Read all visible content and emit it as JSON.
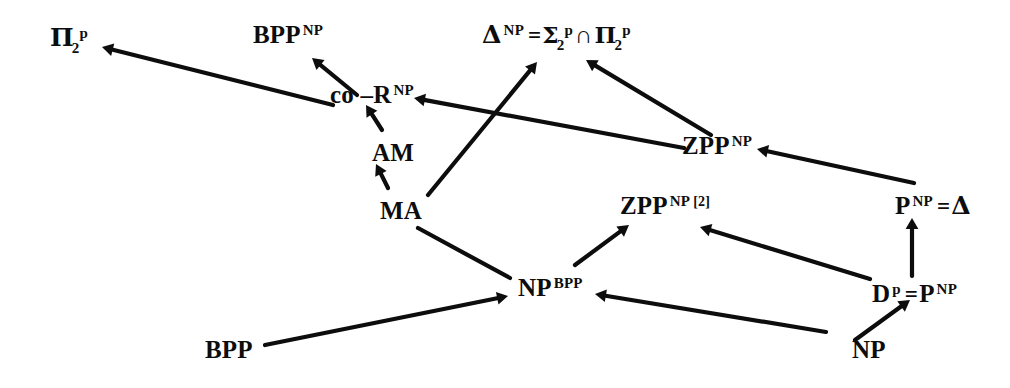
{
  "diagram": {
    "type": "directed-graph",
    "width": 1010,
    "height": 388,
    "background_color": "#ffffff",
    "ink_color": "#0d0d0d",
    "nodes": [
      {
        "id": "pi2p",
        "label": "Π₂ᵖ",
        "base": "Π",
        "sub": "2",
        "sup": "p",
        "x": 50,
        "y": 25
      },
      {
        "id": "bpp_np",
        "label": "BPPᴺᴾ",
        "base": "BPP",
        "sup": "NP",
        "x": 253,
        "y": 22
      },
      {
        "id": "delta_np",
        "label": "Δᴺᴾ = Σ₂ᵖ ∩ Π₂ᵖ",
        "base": "Δ",
        "sup": "NP",
        "equals": "=",
        "rhs_a_base": "Σ",
        "rhs_a_sub": "2",
        "rhs_a_sup": "p",
        "operator": "∩",
        "rhs_b_base": "Π",
        "rhs_b_sub": "2",
        "rhs_b_sup": "p",
        "x": 482,
        "y": 22
      },
      {
        "id": "cor_np",
        "label": "co–Rᴺᴾ",
        "base": "co –R",
        "sup": "NP",
        "x": 330,
        "y": 82
      },
      {
        "id": "am",
        "label": "AM",
        "base": "AM",
        "sup": "",
        "x": 372,
        "y": 140
      },
      {
        "id": "ma",
        "label": "MA",
        "base": "MA",
        "sup": "",
        "x": 380,
        "y": 198
      },
      {
        "id": "zpp_np",
        "label": "ZPPᴺᴾ",
        "base": "ZPP",
        "sup": "NP",
        "x": 682,
        "y": 133
      },
      {
        "id": "zpp_np2",
        "label": "ZPPᴺᴾ [2]",
        "base": "ZPP",
        "sup": "NP",
        "bracket": "[2]",
        "x": 620,
        "y": 193
      },
      {
        "id": "p_np_delta",
        "label": "Pᴺᴾ = Δ",
        "base": "P",
        "sup": "NP",
        "equals": "=",
        "tail": "Δ",
        "x": 895,
        "y": 193
      },
      {
        "id": "np_bpp",
        "label": "NPᴮᴺᴾ",
        "base": "NP",
        "sup": "BPP",
        "x": 518,
        "y": 275
      },
      {
        "id": "dp_pnp",
        "label": "Dᵖ = Pᴺᴾ",
        "base": "D",
        "sup": "p",
        "equals": "=",
        "tail": "P",
        "tail_sup": "NP",
        "x": 872,
        "y": 281
      },
      {
        "id": "bpp",
        "label": "BPP",
        "base": "BPP",
        "sup": "",
        "x": 205,
        "y": 337
      },
      {
        "id": "np",
        "label": "NP",
        "base": "NP",
        "sup": "",
        "x": 852,
        "y": 337
      }
    ],
    "edges": [
      {
        "id": "e1",
        "from": "cor_np",
        "to": "pi2p",
        "x1": 333,
        "y1": 105,
        "x2": 102,
        "y2": 47,
        "arrow_at": "head"
      },
      {
        "id": "e2",
        "from": "cor_np",
        "to": "bpp_np",
        "x1": 357,
        "y1": 95,
        "x2": 312,
        "y2": 58,
        "arrow_at": "head"
      },
      {
        "id": "e3",
        "from": "am",
        "to": "cor_np",
        "x1": 382,
        "y1": 130,
        "x2": 366,
        "y2": 105,
        "arrow_at": "head"
      },
      {
        "id": "e4",
        "from": "ma",
        "to": "am",
        "x1": 388,
        "y1": 188,
        "x2": 376,
        "y2": 164,
        "arrow_at": "head"
      },
      {
        "id": "e5",
        "from": "ma",
        "to": "delta_np",
        "x1": 428,
        "y1": 195,
        "x2": 537,
        "y2": 62,
        "arrow_at": "head"
      },
      {
        "id": "e6",
        "from": "zpp_np",
        "to": "cor_np",
        "x1": 684,
        "y1": 148,
        "x2": 414,
        "y2": 98,
        "arrow_at": "head"
      },
      {
        "id": "e7",
        "from": "zpp_np",
        "to": "delta_np",
        "x1": 711,
        "y1": 135,
        "x2": 586,
        "y2": 60,
        "arrow_at": "head"
      },
      {
        "id": "e8",
        "from": "p_np_delta",
        "to": "zpp_np",
        "x1": 914,
        "y1": 183,
        "x2": 757,
        "y2": 149,
        "arrow_at": "head"
      },
      {
        "id": "e9",
        "from": "np_bpp",
        "to": "zpp_np2",
        "x1": 575,
        "y1": 265,
        "x2": 629,
        "y2": 225,
        "arrow_at": "head"
      },
      {
        "id": "e10",
        "from": "dp_pnp",
        "to": "zpp_np2",
        "x1": 870,
        "y1": 279,
        "x2": 700,
        "y2": 227,
        "arrow_at": "head"
      },
      {
        "id": "e11",
        "from": "dp_pnp",
        "to": "p_np_delta",
        "x1": 912,
        "y1": 276,
        "x2": 912,
        "y2": 218,
        "arrow_at": "head"
      },
      {
        "id": "e12",
        "from": "bpp",
        "to": "np_bpp",
        "x1": 265,
        "y1": 345,
        "x2": 508,
        "y2": 296,
        "arrow_at": "head"
      },
      {
        "id": "e13",
        "from": "ma",
        "to": "np_bpp",
        "x1": 418,
        "y1": 228,
        "x2": 510,
        "y2": 278,
        "arrow_at": "none"
      },
      {
        "id": "e14",
        "from": "np",
        "to": "np_bpp",
        "x1": 826,
        "y1": 332,
        "x2": 595,
        "y2": 294,
        "arrow_at": "head"
      },
      {
        "id": "e15",
        "from": "np",
        "to": "dp_pnp",
        "x1": 855,
        "y1": 340,
        "x2": 910,
        "y2": 300,
        "arrow_at": "head"
      }
    ]
  }
}
